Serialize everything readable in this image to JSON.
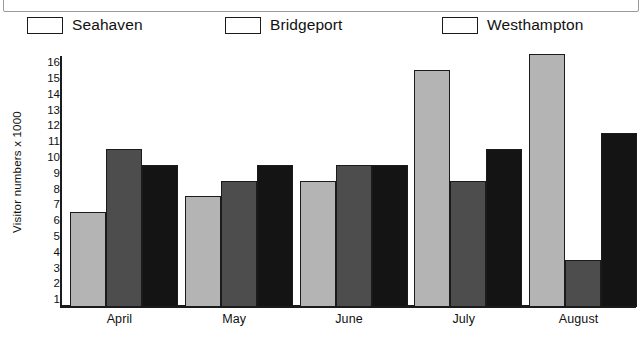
{
  "chart_data": {
    "type": "bar",
    "title": "",
    "xlabel": "",
    "ylabel": "Visitor numbers x 1000",
    "categories": [
      "April",
      "May",
      "June",
      "July",
      "August"
    ],
    "series": [
      {
        "name": "Seahaven",
        "color": "#b4b4b4",
        "values": [
          6.5,
          7.5,
          8.5,
          15.5,
          16.5
        ]
      },
      {
        "name": "Bridgeport",
        "color": "#4d4d4d",
        "values": [
          10.5,
          8.5,
          9.5,
          8.5,
          3.5
        ]
      },
      {
        "name": "Westhampton",
        "color": "#141414",
        "values": [
          9.5,
          9.5,
          9.5,
          10.5,
          11.5
        ]
      }
    ],
    "ylim": [
      0,
      16.8
    ],
    "yticks": [
      16,
      15,
      14,
      13,
      12,
      11,
      10,
      9,
      8,
      7,
      6,
      5,
      4,
      3,
      2,
      1
    ],
    "grid": false,
    "legend_position": "top"
  },
  "legend": {
    "items": [
      {
        "label": "Seahaven"
      },
      {
        "label": "Bridgeport"
      },
      {
        "label": "Westhampton"
      }
    ]
  },
  "axis": {
    "y_axis_title": "Visitor numbers x 1000"
  }
}
